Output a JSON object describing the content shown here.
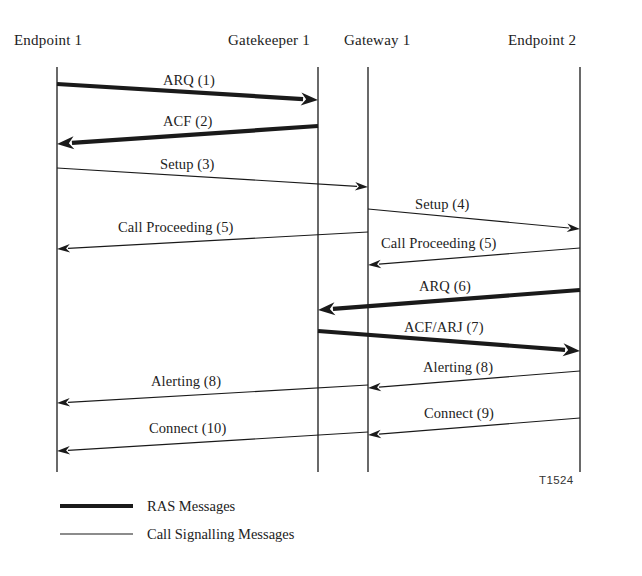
{
  "figure": {
    "id_label": "T1524",
    "background_color": "#ffffff",
    "ink_color": "#1a1a1a",
    "width": 642,
    "height": 576
  },
  "lifelines": [
    {
      "name": "endpoint-1",
      "label": "Endpoint 1",
      "x": 57,
      "label_x": 14,
      "label_y": 32,
      "top": 67,
      "bottom": 472
    },
    {
      "name": "gatekeeper-1",
      "label": "Gatekeeper 1",
      "x": 318,
      "label_x": 228,
      "label_y": 32,
      "top": 67,
      "bottom": 472
    },
    {
      "name": "gateway-1",
      "label": "Gateway 1",
      "x": 368,
      "label_x": 344,
      "label_y": 32,
      "top": 67,
      "bottom": 472
    },
    {
      "name": "endpoint-2",
      "label": "Endpoint 2",
      "x": 580,
      "label_x": 508,
      "label_y": 32,
      "top": 67,
      "bottom": 472
    }
  ],
  "messages": [
    {
      "name": "arq-1",
      "label": "ARQ (1)",
      "kind": "ras",
      "from_x": 57,
      "from_y": 84,
      "to_x": 318,
      "to_y": 100,
      "label_x": 163,
      "label_y": 72
    },
    {
      "name": "acf-2",
      "label": "ACF (2)",
      "kind": "ras",
      "from_x": 318,
      "from_y": 126,
      "to_x": 57,
      "to_y": 144,
      "label_x": 163,
      "label_y": 113
    },
    {
      "name": "setup-3",
      "label": "Setup (3)",
      "kind": "call-signalling",
      "from_x": 57,
      "from_y": 168,
      "to_x": 368,
      "to_y": 187,
      "label_x": 160,
      "label_y": 156
    },
    {
      "name": "setup-4",
      "label": "Setup (4)",
      "kind": "call-signalling",
      "from_x": 368,
      "from_y": 209,
      "to_x": 580,
      "to_y": 229,
      "label_x": 415,
      "label_y": 196
    },
    {
      "name": "call-proceeding-5-right",
      "label": "Call Proceeding (5)",
      "kind": "call-signalling",
      "from_x": 580,
      "from_y": 248,
      "to_x": 368,
      "to_y": 265,
      "label_x": 381,
      "label_y": 235
    },
    {
      "name": "call-proceeding-5-left",
      "label": "Call Proceeding (5)",
      "kind": "call-signalling",
      "from_x": 368,
      "from_y": 232,
      "to_x": 57,
      "to_y": 249,
      "label_x": 118,
      "label_y": 219
    },
    {
      "name": "arq-6",
      "label": "ARQ (6)",
      "kind": "ras",
      "from_x": 580,
      "from_y": 290,
      "to_x": 318,
      "to_y": 310,
      "label_x": 419,
      "label_y": 278
    },
    {
      "name": "acf-arj-7",
      "label": "ACF/ARJ (7)",
      "kind": "ras",
      "from_x": 318,
      "from_y": 331,
      "to_x": 580,
      "to_y": 351,
      "label_x": 404,
      "label_y": 319
    },
    {
      "name": "alerting-8-right",
      "label": "Alerting (8)",
      "kind": "call-signalling",
      "from_x": 580,
      "from_y": 371,
      "to_x": 368,
      "to_y": 388,
      "label_x": 423,
      "label_y": 359
    },
    {
      "name": "alerting-8-left",
      "label": "Alerting (8)",
      "kind": "call-signalling",
      "from_x": 368,
      "from_y": 385,
      "to_x": 57,
      "to_y": 403,
      "label_x": 151,
      "label_y": 373
    },
    {
      "name": "connect-9",
      "label": "Connect (9)",
      "kind": "call-signalling",
      "from_x": 580,
      "from_y": 418,
      "to_x": 368,
      "to_y": 435,
      "label_x": 424,
      "label_y": 405
    },
    {
      "name": "connect-10",
      "label": "Connect (10)",
      "kind": "call-signalling",
      "from_x": 368,
      "from_y": 432,
      "to_x": 57,
      "to_y": 451,
      "label_x": 149,
      "label_y": 420
    }
  ],
  "legend": {
    "items": [
      {
        "name": "legend-ras",
        "label": "RAS Messages",
        "kind": "ras",
        "line_x1": 60,
        "line_x2": 133,
        "line_y": 506,
        "label_x": 147,
        "label_y": 498
      },
      {
        "name": "legend-call-signalling",
        "label": "Call Signalling Messages",
        "kind": "call-signalling",
        "line_x1": 60,
        "line_x2": 133,
        "line_y": 534,
        "label_x": 147,
        "label_y": 526
      }
    ]
  },
  "styles": {
    "ras_stroke_width": 4.2,
    "call_signalling_stroke_width": 1.1,
    "lifeline_stroke_width": 1.3
  }
}
